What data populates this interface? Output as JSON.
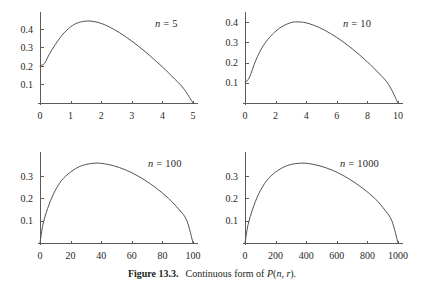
{
  "figure": {
    "caption_label": "Figure 13.3.",
    "caption_text": "Continuous form of ",
    "caption_formula_p": "P",
    "caption_formula_open": "(",
    "caption_formula_n": "n",
    "caption_formula_comma": ", ",
    "caption_formula_r": "r",
    "caption_formula_close": ").",
    "background_color": "#ffffff",
    "curve_color": "#55524f",
    "axis_color": "#5d5a57",
    "text_color": "#231f20"
  },
  "chart_data": [
    {
      "type": "line",
      "title": "n = 5",
      "label_var": "n",
      "label_eq": " = ",
      "label_value": "5",
      "xlabel": "",
      "ylabel": "",
      "xlim": [
        0,
        5
      ],
      "ylim": [
        0,
        0.47
      ],
      "grid": false,
      "legend": "none",
      "xticks": [
        0,
        1,
        2,
        3,
        4,
        5
      ],
      "xticklabels": [
        "0",
        "1",
        "2",
        "3",
        "4",
        "5"
      ],
      "yticks": [
        0.1,
        0.2,
        0.3,
        0.4
      ],
      "yticklabels": [
        "0.1",
        "0.2",
        "0.3",
        "0.4"
      ],
      "peak_x": 1.6,
      "peak_y": 0.443,
      "start_y": 0.2,
      "x": [
        0.0,
        0.15,
        0.3,
        0.5,
        0.75,
        1.0,
        1.25,
        1.6,
        2.0,
        2.4,
        2.8,
        3.2,
        3.6,
        4.0,
        4.4,
        4.7,
        5.0
      ],
      "y": [
        0.2,
        0.215,
        0.262,
        0.316,
        0.372,
        0.411,
        0.434,
        0.443,
        0.43,
        0.399,
        0.358,
        0.309,
        0.254,
        0.195,
        0.13,
        0.077,
        0.0
      ]
    },
    {
      "type": "line",
      "title": "n = 10",
      "label_var": "n",
      "label_eq": " = ",
      "label_value": "10",
      "xlabel": "",
      "ylabel": "",
      "xlim": [
        0,
        10
      ],
      "ylim": [
        0,
        0.43
      ],
      "grid": false,
      "legend": "none",
      "xticks": [
        0,
        2,
        4,
        6,
        8,
        10
      ],
      "xticklabels": [
        "0",
        "2",
        "4",
        "6",
        "8",
        "10"
      ],
      "yticks": [
        0.1,
        0.2,
        0.3,
        0.4
      ],
      "yticklabels": [
        "0.1",
        "0.2",
        "0.3",
        "0.4"
      ],
      "peak_x": 3.4,
      "peak_y": 0.401,
      "start_y": 0.1,
      "x": [
        0.0,
        0.3,
        0.7,
        1.2,
        1.8,
        2.4,
        3.0,
        3.4,
        4.0,
        4.8,
        5.6,
        6.4,
        7.2,
        8.0,
        8.8,
        9.4,
        10.0
      ],
      "y": [
        0.1,
        0.128,
        0.21,
        0.284,
        0.34,
        0.377,
        0.397,
        0.401,
        0.396,
        0.375,
        0.343,
        0.303,
        0.256,
        0.203,
        0.143,
        0.09,
        0.0
      ]
    },
    {
      "type": "line",
      "title": "n = 100",
      "label_var": "n",
      "label_eq": " = ",
      "label_value": "100",
      "xlabel": "",
      "ylabel": "",
      "xlim": [
        0,
        100
      ],
      "ylim": [
        0,
        0.39
      ],
      "grid": false,
      "legend": "none",
      "xticks": [
        0,
        20,
        40,
        60,
        80,
        100
      ],
      "xticklabels": [
        "0",
        "20",
        "40",
        "60",
        "80",
        "100"
      ],
      "yticks": [
        0.1,
        0.2,
        0.3
      ],
      "yticklabels": [
        "0.1",
        "0.2",
        "0.3"
      ],
      "peak_x": 36,
      "peak_y": 0.358,
      "start_y": 0.0,
      "x": [
        0,
        2,
        5,
        9,
        14,
        20,
        27,
        36,
        44,
        52,
        60,
        68,
        76,
        84,
        91,
        96,
        100
      ],
      "y": [
        0.0,
        0.085,
        0.155,
        0.223,
        0.279,
        0.318,
        0.346,
        0.358,
        0.353,
        0.338,
        0.315,
        0.284,
        0.246,
        0.2,
        0.149,
        0.1,
        0.0
      ]
    },
    {
      "type": "line",
      "title": "n = 1000",
      "label_var": "n",
      "label_eq": " = ",
      "label_value": "1000",
      "xlabel": "",
      "ylabel": "",
      "xlim": [
        0,
        1000
      ],
      "ylim": [
        0,
        0.39
      ],
      "grid": false,
      "legend": "none",
      "xticks": [
        0,
        200,
        400,
        600,
        800,
        1000
      ],
      "xticklabels": [
        "0",
        "200",
        "400",
        "600",
        "800",
        "1000"
      ],
      "yticks": [
        0.1,
        0.2,
        0.3
      ],
      "yticklabels": [
        "0.1",
        "0.2",
        "0.3"
      ],
      "peak_x": 370,
      "peak_y": 0.358,
      "start_y": 0.0,
      "x": [
        0,
        20,
        50,
        90,
        140,
        200,
        280,
        370,
        450,
        530,
        610,
        690,
        770,
        850,
        915,
        960,
        1000
      ],
      "y": [
        0.0,
        0.082,
        0.152,
        0.221,
        0.278,
        0.318,
        0.348,
        0.358,
        0.352,
        0.337,
        0.314,
        0.283,
        0.245,
        0.199,
        0.147,
        0.099,
        0.0
      ]
    }
  ]
}
